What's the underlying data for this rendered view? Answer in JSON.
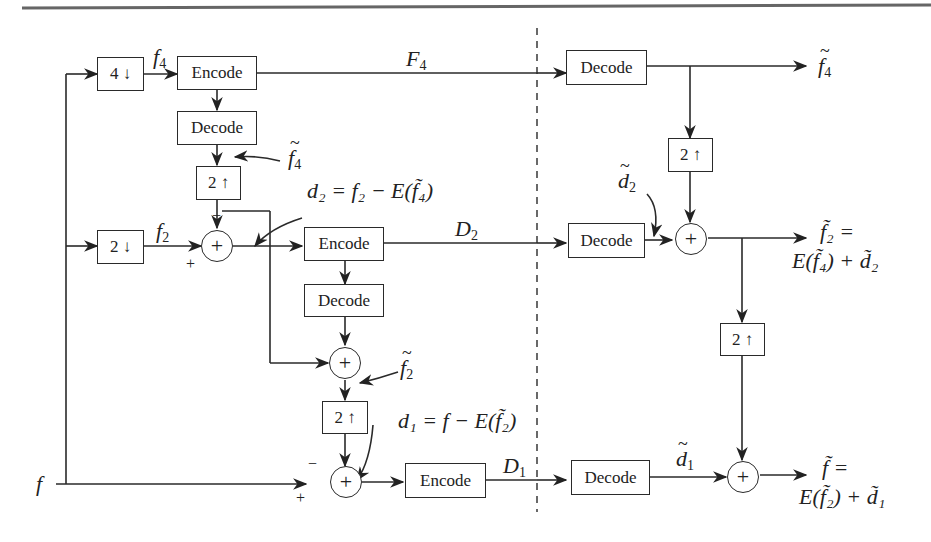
{
  "diagram": {
    "type": "hierarchical-encoder-decoder-block-diagram",
    "divider": "dashed vertical line separating encoder (left) from decoder (right)",
    "blocks": {
      "down4": {
        "label": "4",
        "arrow": "↓"
      },
      "down2": {
        "label": "2",
        "arrow": "↓"
      },
      "up_enc_top": {
        "label": "2",
        "arrow": "↑"
      },
      "up_enc_mid": {
        "label": "2",
        "arrow": "↑"
      },
      "up_dec_top": {
        "label": "2",
        "arrow": "↑"
      },
      "up_dec_mid": {
        "label": "2",
        "arrow": "↑"
      },
      "encode_top": "Encode",
      "decode_top_local": "Decode",
      "encode_mid": "Encode",
      "decode_mid_local": "Decode",
      "encode_bot": "Encode",
      "decode_top_rx": "Decode",
      "decode_mid_rx": "Decode",
      "decode_bot_rx": "Decode"
    },
    "summers": {
      "symbol": "+",
      "count": 5
    },
    "signs": {
      "plus": "+",
      "minus": "−"
    },
    "labels": {
      "f_input": "f",
      "f4": "f",
      "f4_sub": "4",
      "f2": "f",
      "f2_sub": "2",
      "F4": "F",
      "F4_sub": "4",
      "D2": "D",
      "D2_sub": "2",
      "D1": "D",
      "D1_sub": "1",
      "f4_tilde_local": "f",
      "f4_tilde_local_sub": "4",
      "f2_tilde_local": "f",
      "f2_tilde_local_sub": "2",
      "d2_eq": "d₂ = f₂ − E(f̃₄)",
      "d1_eq": "d₁ = f − E(f̃₂)",
      "d2_tilde": "d",
      "d2_tilde_sub": "2",
      "d1_tilde": "d",
      "d1_tilde_sub": "1",
      "out_f4": "f",
      "out_f4_sub": "4",
      "out_f2_line1": "f̃₂ =",
      "out_f2_line2": "E(f̃₄) + d̃₂",
      "out_f_line1": "f̃ =",
      "out_f_line2": "E(f̃₂) + d̃₁"
    }
  }
}
